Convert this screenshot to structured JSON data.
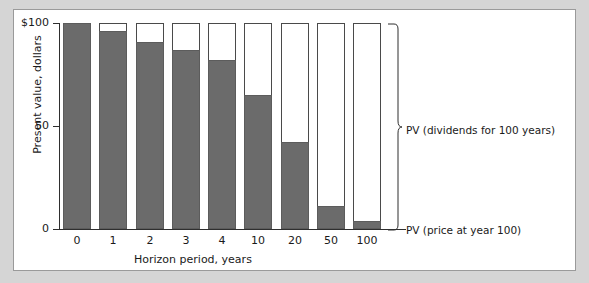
{
  "chart_data": {
    "type": "bar",
    "stacked": true,
    "title": "",
    "xlabel": "Horizon period, years",
    "ylabel": "Present value, dollars",
    "categories": [
      "0",
      "1",
      "2",
      "3",
      "4",
      "10",
      "20",
      "50",
      "100"
    ],
    "ylim": [
      0,
      100
    ],
    "ytick_values": [
      0,
      50,
      100
    ],
    "ytick_labels": [
      "0",
      "50",
      "$100"
    ],
    "grid": false,
    "legend_position": "right",
    "series": [
      {
        "name": "PV (price at year 100)",
        "color": "#6b6b6b",
        "values": [
          100,
          96,
          91,
          87,
          82,
          65,
          42,
          11,
          4
        ]
      },
      {
        "name": "PV (dividends for 100 years)",
        "color": "#ffffff",
        "values": [
          0,
          4,
          9,
          13,
          18,
          35,
          58,
          89,
          96
        ]
      }
    ],
    "totals": [
      100,
      100,
      100,
      100,
      100,
      100,
      100,
      100,
      100
    ],
    "annotations": [
      {
        "text": "PV (dividends for 100 years)",
        "target": "white-segment-brace"
      },
      {
        "text": "PV (price at year 100)",
        "target": "gray-segment-leader"
      }
    ]
  },
  "axes": {
    "y_title": "Present value, dollars",
    "x_title": "Horizon period, years",
    "y_ticks": [
      "$100",
      "50",
      "0"
    ],
    "x_ticks": [
      "0",
      "1",
      "2",
      "3",
      "4",
      "10",
      "20",
      "50",
      "100"
    ]
  },
  "legend": {
    "dividends_label": "PV (dividends for 100 years)",
    "price_label": "PV (price at year 100)"
  },
  "colors": {
    "page_background": "#d5d5d5",
    "panel_background": "#ffffff",
    "panel_border": "#9a9a9a",
    "bar_fill": "#6b6b6b",
    "bar_outline": "#4a4a4a",
    "axis": "#2e2e2e",
    "text": "#1a1a1a"
  }
}
